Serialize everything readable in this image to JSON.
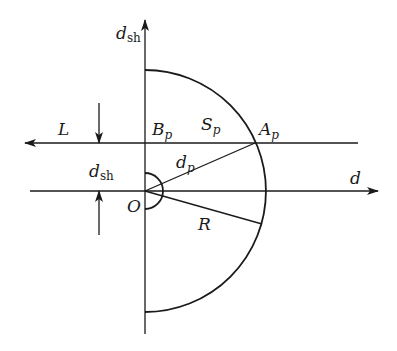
{
  "diagram": {
    "type": "geometric-schematic",
    "origin": {
      "label": "O",
      "x": 145,
      "y": 191
    },
    "radius": {
      "label": "R",
      "value_px": 121
    },
    "axes": {
      "vertical": {
        "label": "d",
        "subscript": "sh"
      },
      "horizontal": {
        "label": "d"
      }
    },
    "upper_line": {
      "label": "L"
    },
    "points": [
      {
        "name": "B",
        "subscript": "p"
      },
      {
        "name": "A",
        "subscript": "p"
      }
    ],
    "segments": [
      {
        "name": "S",
        "subscript": "p"
      },
      {
        "name": "d",
        "subscript": "p"
      }
    ],
    "gap_dimension": {
      "label": "d",
      "subscript": "sh"
    }
  },
  "labels": {
    "dsh_axis_main": "d",
    "dsh_axis_sub": "sh",
    "L": "L",
    "Bp_main": "B",
    "Bp_sub": "p",
    "Sp_main": "S",
    "Sp_sub": "p",
    "Ap_main": "A",
    "Ap_sub": "p",
    "dp_main": "d",
    "dp_sub": "p",
    "dsh_gap_main": "d",
    "dsh_gap_sub": "sh",
    "O": "O",
    "R": "R",
    "d": "d"
  }
}
